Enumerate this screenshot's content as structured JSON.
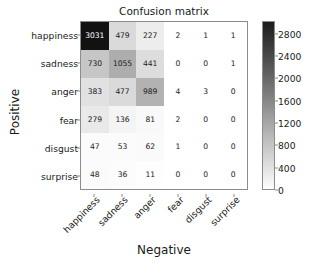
{
  "chart_data": {
    "type": "heatmap",
    "title": "Confusion matrix",
    "xlabel": "Negative",
    "ylabel": "Positive",
    "categories": [
      "happiness",
      "sadness",
      "anger",
      "fear",
      "disgust",
      "surprise"
    ],
    "row_labels": [
      "happiness",
      "sadness",
      "anger",
      "fear",
      "disgust",
      "surprise"
    ],
    "col_labels": [
      "happiness",
      "sadness",
      "anger",
      "fear",
      "disgust",
      "surprise"
    ],
    "values": [
      [
        3031,
        479,
        227,
        2,
        1,
        1
      ],
      [
        730,
        1055,
        441,
        0,
        0,
        1
      ],
      [
        383,
        477,
        989,
        4,
        3,
        0
      ],
      [
        279,
        136,
        81,
        2,
        0,
        0
      ],
      [
        47,
        53,
        62,
        1,
        0,
        0
      ],
      [
        48,
        36,
        11,
        0,
        0,
        0
      ]
    ],
    "colormap": "greys",
    "colormap_reversed": true,
    "vmin": 0,
    "vmax": 3031,
    "grid": false,
    "colorbar": {
      "position": "right",
      "ticks": [
        2800,
        2400,
        2000,
        1600,
        1200,
        800,
        400,
        0
      ],
      "min": 0,
      "max": 3031
    },
    "xtick_rotation": -45
  }
}
